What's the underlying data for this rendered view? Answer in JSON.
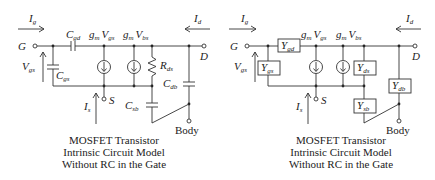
{
  "diagrams": [
    {
      "id": "left",
      "title": "MOSFET Transistor",
      "caption_lines": [
        "MOSFET Transistor",
        "Intrinsic Circuit Model",
        "Without RC in the Gate"
      ],
      "terminals": {
        "gate": "G",
        "drain": "D",
        "source": "S",
        "body": "Body"
      },
      "currents": {
        "ig": "I",
        "ig_sub": "g",
        "id": "I",
        "id_sub": "d",
        "is": "I",
        "is_sub": "s"
      },
      "voltage": {
        "main": "V",
        "sub": "gs"
      },
      "elements": {
        "cgd": {
          "main": "C",
          "sub": "gd"
        },
        "cgs": {
          "main": "C",
          "sub": "gs"
        },
        "rds": {
          "main": "R",
          "sub": "ds"
        },
        "cdb": {
          "main": "C",
          "sub": "db"
        },
        "csb": {
          "main": "C",
          "sub": "sb"
        },
        "src1": {
          "gm": "g",
          "gm_sub": "m",
          "v": "V",
          "v_sub": "gs"
        },
        "src2": {
          "gm": "g",
          "gm_sub": "m",
          "v": "V",
          "v_sub": "bs"
        }
      }
    },
    {
      "id": "right",
      "caption_lines": [
        "MOSFET Transistor",
        "Intrinsic Circuit Model",
        "Without RC in the Gate"
      ],
      "terminals": {
        "gate": "G",
        "drain": "D",
        "source": "S",
        "body": "Body"
      },
      "currents": {
        "ig": "I",
        "ig_sub": "g",
        "id": "I",
        "id_sub": "d",
        "is": "I",
        "is_sub": "s"
      },
      "voltage": {
        "main": "V",
        "sub": "gs"
      },
      "elements": {
        "ygd": {
          "main": "Y",
          "sub": "gd"
        },
        "ygs": {
          "main": "Y",
          "sub": "gs"
        },
        "yds": {
          "main": "Y",
          "sub": "ds"
        },
        "ydb": {
          "main": "Y",
          "sub": "db"
        },
        "ysb": {
          "main": "Y",
          "sub": "sb"
        },
        "src1": {
          "gm": "g",
          "gm_sub": "m",
          "v": "V",
          "v_sub": "gs"
        },
        "src2": {
          "gm": "g",
          "gm_sub": "m",
          "v": "V",
          "v_sub": "bs"
        }
      }
    }
  ]
}
